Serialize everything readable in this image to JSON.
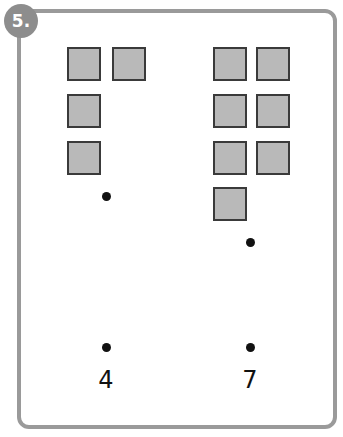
{
  "badge": {
    "label": "5.",
    "color": "#8d8d8d"
  },
  "frame": {
    "border_color": "#9a9a9a"
  },
  "groups": [
    {
      "name": "left",
      "count": 4,
      "squares": [
        [
          67,
          47
        ],
        [
          112,
          47
        ],
        [
          67,
          94
        ],
        [
          67,
          141
        ]
      ],
      "dots": [
        [
          102,
          192
        ],
        [
          102,
          343
        ]
      ],
      "number": "4"
    },
    {
      "name": "right",
      "count": 7,
      "squares": [
        [
          213,
          47
        ],
        [
          256,
          47
        ],
        [
          213,
          94
        ],
        [
          256,
          94
        ],
        [
          213,
          141
        ],
        [
          256,
          141
        ],
        [
          213,
          187
        ]
      ],
      "dots": [
        [
          246,
          238
        ],
        [
          246,
          343
        ]
      ],
      "number": "7"
    }
  ]
}
